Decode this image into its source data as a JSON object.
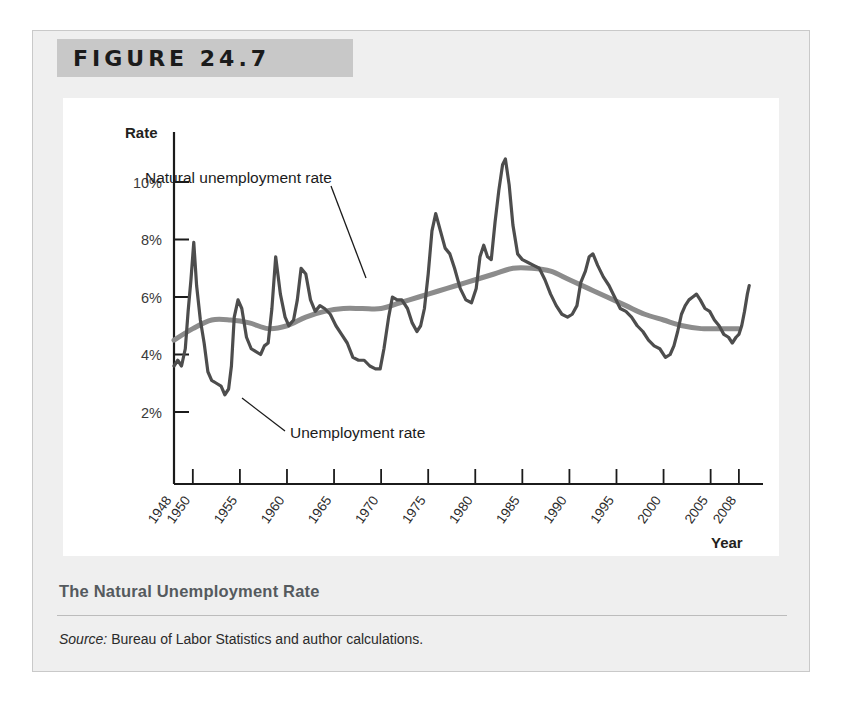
{
  "figure": {
    "header_label": "FIGURE 24.7",
    "caption_title": "The Natural Unemployment Rate",
    "source_word": "Source:",
    "source_text": " Bureau of Labor Statistics and author calculations."
  },
  "colors": {
    "panel_background": "#efefef",
    "header_band": "#c8c8c8",
    "canvas": "#ffffff",
    "unemployment_line": "#4d4d4d",
    "natural_rate_line": "#8c8c8c",
    "axis": "#1b1b1b",
    "caption_title": "#555a5e"
  },
  "chart_data": {
    "type": "line",
    "title": "The Natural Unemployment Rate",
    "xlabel": "Year",
    "ylabel": "Rate",
    "grid": false,
    "legend_position": "annotations-inline",
    "xlim": [
      1948,
      2009.5
    ],
    "ylim": [
      0,
      11.2
    ],
    "ytick_labels": [
      "2%",
      "4%",
      "6%",
      "8%",
      "10%"
    ],
    "ytick_values": [
      2,
      4,
      6,
      8,
      10
    ],
    "xtick_labels": [
      "1948",
      "1950",
      "1955",
      "1960",
      "1965",
      "1970",
      "1975",
      "1980",
      "1985",
      "1990",
      "1995",
      "2000",
      "2005",
      "2008"
    ],
    "xtick_values": [
      1948,
      1950,
      1955,
      1960,
      1965,
      1970,
      1975,
      1980,
      1985,
      1990,
      1995,
      2000,
      2005,
      2008
    ],
    "annotations": [
      {
        "name": "natural-unemployment-rate",
        "text": "Natural unemployment rate",
        "x": 1953.0,
        "y": 9.1
      },
      {
        "name": "unemployment-rate",
        "text": "Unemployment rate",
        "x": 1958.0,
        "y": 2.45
      }
    ],
    "series": [
      {
        "name": "Unemployment rate",
        "color": "#4d4d4d",
        "x": [
          1948.0,
          1948.4,
          1948.8,
          1949.2,
          1949.5,
          1949.8,
          1950.1,
          1950.4,
          1950.8,
          1951.2,
          1951.6,
          1952.0,
          1952.5,
          1953.0,
          1953.4,
          1953.8,
          1954.1,
          1954.4,
          1954.8,
          1955.2,
          1955.7,
          1956.2,
          1956.7,
          1957.2,
          1957.6,
          1958.0,
          1958.4,
          1958.8,
          1959.3,
          1959.8,
          1960.2,
          1960.7,
          1961.1,
          1961.5,
          1962.0,
          1962.5,
          1963.0,
          1963.5,
          1964.0,
          1964.6,
          1965.2,
          1965.8,
          1966.4,
          1967.0,
          1967.6,
          1968.2,
          1968.8,
          1969.4,
          1969.9,
          1970.3,
          1970.8,
          1971.2,
          1971.7,
          1972.2,
          1972.8,
          1973.3,
          1973.8,
          1974.2,
          1974.6,
          1975.0,
          1975.4,
          1975.8,
          1976.3,
          1976.8,
          1977.3,
          1977.8,
          1978.4,
          1979.0,
          1979.6,
          1980.1,
          1980.5,
          1980.9,
          1981.3,
          1981.7,
          1982.1,
          1982.5,
          1982.9,
          1983.2,
          1983.6,
          1984.0,
          1984.5,
          1985.0,
          1985.6,
          1986.2,
          1986.8,
          1987.4,
          1988.0,
          1988.6,
          1989.2,
          1989.8,
          1990.3,
          1990.8,
          1991.2,
          1991.7,
          1992.1,
          1992.5,
          1993.0,
          1993.6,
          1994.2,
          1994.8,
          1995.4,
          1996.0,
          1996.6,
          1997.2,
          1997.8,
          1998.4,
          1999.0,
          1999.6,
          2000.2,
          2000.7,
          2001.1,
          2001.5,
          2001.9,
          2002.3,
          2002.7,
          2003.1,
          2003.5,
          2003.9,
          2004.4,
          2004.9,
          2005.4,
          2005.9,
          2006.4,
          2006.9,
          2007.3,
          2007.7,
          2008.0,
          2008.3,
          2008.6,
          2008.9,
          2009.1
        ],
        "y": [
          3.6,
          3.8,
          3.6,
          4.2,
          5.5,
          6.6,
          7.9,
          6.4,
          5.2,
          4.4,
          3.4,
          3.1,
          3.0,
          2.9,
          2.6,
          2.8,
          3.6,
          5.3,
          5.9,
          5.6,
          4.6,
          4.2,
          4.1,
          4.0,
          4.3,
          4.4,
          5.6,
          7.4,
          6.1,
          5.3,
          5.0,
          5.2,
          5.9,
          7.0,
          6.8,
          5.9,
          5.5,
          5.7,
          5.6,
          5.4,
          5.0,
          4.7,
          4.4,
          3.9,
          3.8,
          3.8,
          3.6,
          3.5,
          3.5,
          4.2,
          5.3,
          6.0,
          5.9,
          5.9,
          5.6,
          5.1,
          4.8,
          5.0,
          5.6,
          6.8,
          8.3,
          8.9,
          8.3,
          7.7,
          7.5,
          7.0,
          6.3,
          5.9,
          5.8,
          6.3,
          7.4,
          7.8,
          7.4,
          7.3,
          8.6,
          9.7,
          10.6,
          10.8,
          9.9,
          8.5,
          7.5,
          7.3,
          7.2,
          7.1,
          7.0,
          6.6,
          6.1,
          5.7,
          5.4,
          5.3,
          5.4,
          5.7,
          6.5,
          6.9,
          7.4,
          7.5,
          7.1,
          6.7,
          6.4,
          6.0,
          5.6,
          5.5,
          5.3,
          5.0,
          4.8,
          4.5,
          4.3,
          4.2,
          3.9,
          4.0,
          4.3,
          4.8,
          5.4,
          5.7,
          5.9,
          6.0,
          6.1,
          5.9,
          5.6,
          5.5,
          5.2,
          5.0,
          4.7,
          4.6,
          4.4,
          4.6,
          4.7,
          5.0,
          5.5,
          6.1,
          6.4
        ]
      },
      {
        "name": "Natural unemployment rate",
        "color": "#8c8c8c",
        "x": [
          1948.0,
          1950.0,
          1952.0,
          1954.0,
          1956.0,
          1958.0,
          1960.0,
          1962.0,
          1964.0,
          1966.0,
          1968.0,
          1970.0,
          1972.0,
          1974.0,
          1976.0,
          1978.0,
          1980.0,
          1982.0,
          1984.0,
          1986.0,
          1988.0,
          1990.0,
          1992.0,
          1994.0,
          1996.0,
          1998.0,
          2000.0,
          2002.0,
          2004.0,
          2006.0,
          2008.0
        ],
        "y": [
          4.5,
          4.9,
          5.2,
          5.2,
          5.1,
          4.9,
          5.0,
          5.3,
          5.5,
          5.6,
          5.6,
          5.6,
          5.8,
          6.0,
          6.2,
          6.4,
          6.6,
          6.8,
          7.0,
          7.0,
          6.9,
          6.6,
          6.3,
          6.0,
          5.7,
          5.4,
          5.2,
          5.0,
          4.9,
          4.9,
          4.9
        ]
      }
    ]
  }
}
